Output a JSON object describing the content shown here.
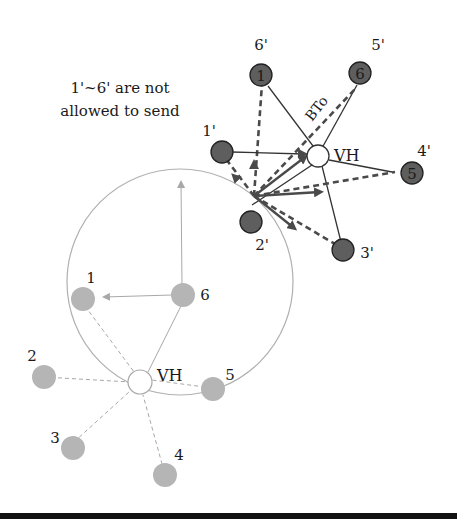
{
  "colors": {
    "dark_node": "#5e5e5e",
    "light_node": "#b5b5b5",
    "vh_fill": "#ffffff",
    "line_dark": "#333333",
    "arrow_dark": "#4a4a4a",
    "line_light": "#a8a8a8",
    "range_circle": "#b0b0b0"
  },
  "annotation": {
    "line1": "1'~6' are not",
    "line2": "allowed to send"
  },
  "bto_label": "BTo",
  "lower_cluster": {
    "hub_label": "VH",
    "nodes": [
      {
        "label": "1"
      },
      {
        "label": "2"
      },
      {
        "label": "3"
      },
      {
        "label": "4"
      },
      {
        "label": "5"
      },
      {
        "label": "6"
      }
    ]
  },
  "upper_cluster": {
    "hub_label": "VH",
    "nodes": [
      {
        "inner": "1",
        "prime": "6'"
      },
      {
        "inner": "",
        "prime": "1'"
      },
      {
        "inner": "",
        "prime": "2'"
      },
      {
        "inner": "",
        "prime": "3'"
      },
      {
        "inner": "5",
        "prime": "4'"
      },
      {
        "inner": "6",
        "prime": "5'"
      }
    ]
  }
}
